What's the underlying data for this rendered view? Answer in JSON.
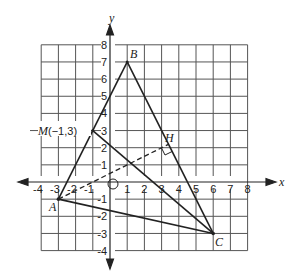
{
  "figure": {
    "type": "coordinate-geometry",
    "axes": {
      "x_label": "x",
      "y_label": "y",
      "x_range": [
        -4,
        8
      ],
      "y_range": [
        -4,
        8
      ],
      "x_ticks": [
        "-4",
        "-3",
        "-2",
        "-1",
        "1",
        "2",
        "3",
        "4",
        "5",
        "6",
        "7",
        "8"
      ],
      "y_ticks": [
        "8",
        "7",
        "6",
        "5",
        "4",
        "3",
        "2",
        "1",
        "-1",
        "-2",
        "-3",
        "-4"
      ],
      "origin_marker": "circle"
    },
    "points": {
      "A": {
        "label": "A",
        "coords": [
          -3,
          -1
        ]
      },
      "B": {
        "label": "B",
        "coords": [
          1,
          7
        ]
      },
      "C": {
        "label": "C",
        "coords": [
          6,
          -3
        ]
      },
      "M": {
        "label": "M(−1,3)",
        "coords": [
          -1,
          3
        ]
      },
      "H": {
        "label": "H",
        "coords": [
          3.4,
          2.2
        ]
      }
    },
    "segments": [
      {
        "from": "A",
        "to": "B",
        "style": "solid"
      },
      {
        "from": "B",
        "to": "C",
        "style": "solid"
      },
      {
        "from": "A",
        "to": "C",
        "style": "solid"
      },
      {
        "from": "M",
        "to": "C",
        "style": "solid"
      },
      {
        "from": "A",
        "to": "H",
        "style": "dashed",
        "note": "altitude from A to BC, right angle at H"
      }
    ]
  }
}
